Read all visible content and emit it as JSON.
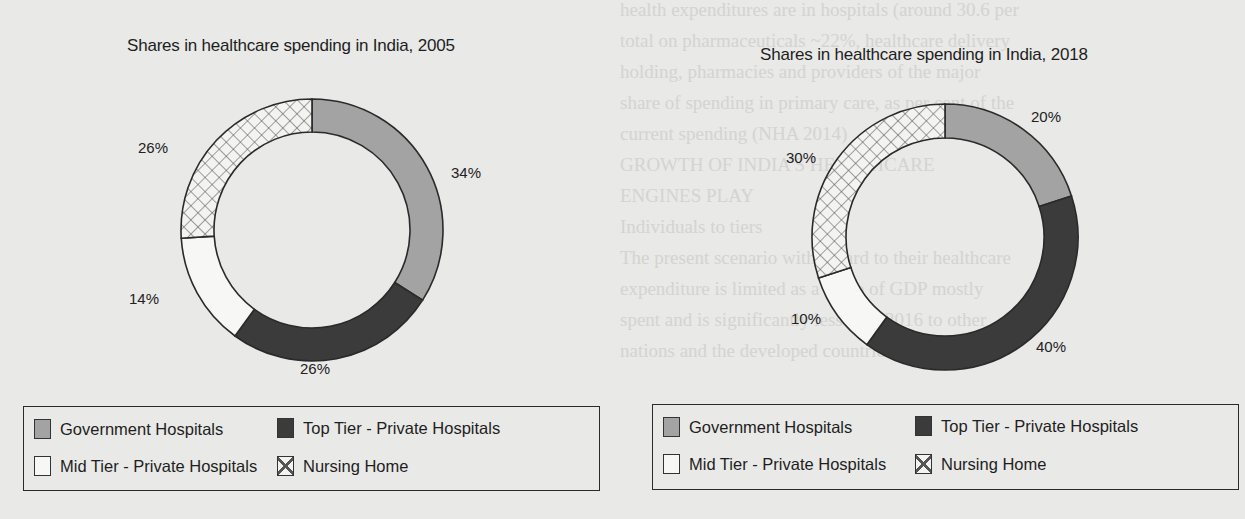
{
  "background_text": {
    "left_column": [
      "health expenditures are in hospitals (around 30.6 per",
      "total on pharmaceuticals ~22%, healthcare delivery",
      "holding, pharmacies and providers of the major",
      "share of spending in primary care, as per cent of the",
      "current spending (NHA 2014)",
      "GROWTH OF INDIA'S HEALTHCARE",
      "ENGINES PLAY",
      "Individuals to tiers",
      "The present scenario with regard to their healthcare",
      "expenditure is limited as a share of GDP mostly",
      "spent and is significantly less than 2016 to other",
      "nations and the developed countries of the OECD"
    ],
    "right_column": [
      "use, pseudonyms of private assistance, secondary",
      "and tertiary care institutions which can be refer",
      "to specialist and super-specialist hospitals and medical",
      "colleges and other centres of care, according to",
      "data of India's National Health Accounts (NHA)",
      "primary care accounted 44% per cent of current health",
      "expenditures in 2014-15 while secondary and tertiary",
      "care accounted for 35 per cent and 21 per cent",
      "respectively (MoHFW 2018)",
      "In India there are various hospitals and in",
      "several institutions for AYUSH Ayurveda, Yoga and",
      "others such as public hospitals and nursing homes"
    ]
  },
  "chart_data": [
    {
      "type": "pie",
      "variant": "donut",
      "title": "Shares in healthcare spending in India, 2005",
      "categories": [
        "Government Hospitals",
        "Top Tier - Private Hospitals",
        "Mid Tier - Private Hospitals",
        "Nursing Home"
      ],
      "values": [
        34,
        26,
        14,
        26
      ],
      "labels": [
        "34%",
        "26%",
        "14%",
        "26%"
      ],
      "start_angle": "12 o'clock",
      "direction": "clockwise",
      "legend_position": "bottom (boxed, 2x2)"
    },
    {
      "type": "pie",
      "variant": "donut",
      "title": "Shares in healthcare spending in India, 2018",
      "categories": [
        "Government Hospitals",
        "Top Tier - Private Hospitals",
        "Mid Tier - Private Hospitals",
        "Nursing Home"
      ],
      "values": [
        20,
        40,
        10,
        30
      ],
      "labels": [
        "20%",
        "40%",
        "10%",
        "30%"
      ],
      "start_angle": "12 o'clock",
      "direction": "clockwise",
      "legend_position": "bottom (boxed, 2x2)"
    }
  ],
  "colors": {
    "government": "#a3a3a3",
    "top_tier": "#3b3b3b",
    "mid_tier": "#f7f7f5",
    "nursing_home_pattern": "cross-hatch",
    "outline": "#2a2a2a",
    "background": "#e9e9e7"
  },
  "charts": {
    "left": {
      "title": "Shares in healthcare spending in India, 2005",
      "labels": {
        "government": "34%",
        "top_tier": "26%",
        "mid_tier": "14%",
        "nursing_home": "26%"
      },
      "legend": {
        "government": "Government Hospitals",
        "top_tier": "Top Tier - Private Hospitals",
        "mid_tier": "Mid Tier - Private Hospitals",
        "nursing_home": "Nursing Home"
      }
    },
    "right": {
      "title": "Shares in healthcare spending in India, 2018",
      "labels": {
        "government": "20%",
        "top_tier": "40%",
        "mid_tier": "10%",
        "nursing_home": "30%"
      },
      "legend": {
        "government": "Government Hospitals",
        "top_tier": "Top Tier - Private Hospitals",
        "mid_tier": "Mid Tier - Private Hospitals",
        "nursing_home": "Nursing Home"
      }
    }
  }
}
